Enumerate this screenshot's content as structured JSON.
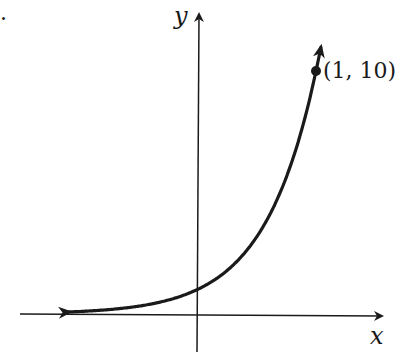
{
  "chart_data": {
    "type": "line",
    "title": "",
    "function": "y = 10^x",
    "xlabel": "x",
    "ylabel": "y",
    "x": [
      -1.1,
      -0.75,
      -0.5,
      -0.25,
      0,
      0.25,
      0.5,
      0.75,
      1,
      1.04
    ],
    "values": [
      0.08,
      0.18,
      0.32,
      0.56,
      1,
      1.78,
      3.16,
      5.62,
      10,
      11
    ],
    "annotations": [
      {
        "x": 1,
        "y": 10,
        "label": "(1, 10)"
      }
    ],
    "grid": false,
    "legend": "none",
    "axis_ticks": false
  },
  "labels": {
    "x_axis": "x",
    "y_axis": "y",
    "point": "(1, 10)",
    "margin_mark": "."
  }
}
